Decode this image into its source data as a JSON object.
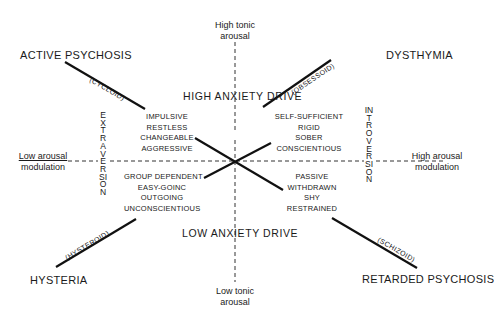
{
  "diagram": {
    "axes": {
      "top": "High tonic arousal",
      "top_line1": "High tonic",
      "top_line2": "arousal",
      "bottom_line1": "Low tonic",
      "bottom_line2": "arousal",
      "left_line1": "Low arousal",
      "left_line2": "modulation",
      "right_line1": "High arousal",
      "right_line2": "modulation"
    },
    "drives": {
      "high": "HIGH ANXIETY DRIVE",
      "low": "LOW ANXIETY DRIVE"
    },
    "dimensions": {
      "extraversion": "EXTRAVERSION",
      "introversion": "INTROVERSION"
    },
    "corners": {
      "top_left": "ACTIVE PSYCHOSIS",
      "top_right": "DYSTHYMIA",
      "bottom_left": "HYSTERIA",
      "bottom_right": "RETARDED PSYCHOSIS"
    },
    "line_labels": {
      "top_left": "(CYCLOID)",
      "top_right": "(OBSESSOID)",
      "bottom_left": "(HYSTEROID)",
      "bottom_right": "(SCHIZOID)"
    },
    "traits": {
      "top_left": [
        "IMPULSIVE",
        "RESTLESS",
        "CHANGEABLE",
        "AGGRESSIVE"
      ],
      "top_right": [
        "SELF-SUFFICIENT",
        "RIGID",
        "SOBER",
        "CONSCIENTIOUS"
      ],
      "bottom_left": [
        "GROUP DEPENDENT",
        "EASY-GOINC",
        "OUTGOING",
        "UNCONSCIENTIOUS"
      ],
      "bottom_right": [
        "PASSIVE",
        "WITHDRAWN",
        "SHY",
        "RESTRAINED"
      ]
    },
    "colors": {
      "ink": "#1a1a1a",
      "background": "#ffffff"
    }
  }
}
